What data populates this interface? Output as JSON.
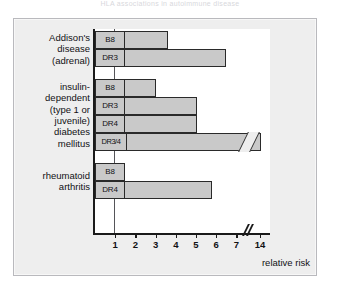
{
  "top_caption": "HLA associations in autoimmune disease",
  "chart_data": {
    "type": "bar",
    "orientation": "horizontal",
    "title": "",
    "xlabel": "relative risk",
    "ylabel": "",
    "xlim": [
      0,
      15
    ],
    "grid": false,
    "legend": false,
    "reference_line": 1,
    "axis_break": {
      "after": 7,
      "before": 14
    },
    "xticks": [
      "1",
      "2",
      "3",
      "4",
      "5",
      "6",
      "7",
      "14"
    ],
    "groups": [
      {
        "name": "Addison's\ndisease\n(adrenal)",
        "bars": [
          {
            "label": "B8",
            "value": 3.6
          },
          {
            "label": "DR3",
            "value": 6.5
          }
        ]
      },
      {
        "name": "insulin-\ndependent\n(type 1 or\njuvenile)\ndiabetes\nmellitus",
        "bars": [
          {
            "label": "B8",
            "value": 3.0
          },
          {
            "label": "DR3",
            "value": 5.05
          },
          {
            "label": "DR4",
            "value": 5.05
          },
          {
            "label": "DR3/4",
            "value": 14.5,
            "broken": true
          }
        ]
      },
      {
        "name": "rheumatoid\narthritis",
        "bars": [
          {
            "label": "B8",
            "value": 1.0
          },
          {
            "label": "DR4",
            "value": 5.8
          }
        ]
      }
    ],
    "colors": {
      "bar_fill": "#c9c9c9",
      "bar_stroke": "#2a2a2a",
      "panel_bg": "#eeeeee",
      "plot_bg": "#ffffff",
      "axis": "#1a1a1a",
      "text": "#111114"
    }
  }
}
